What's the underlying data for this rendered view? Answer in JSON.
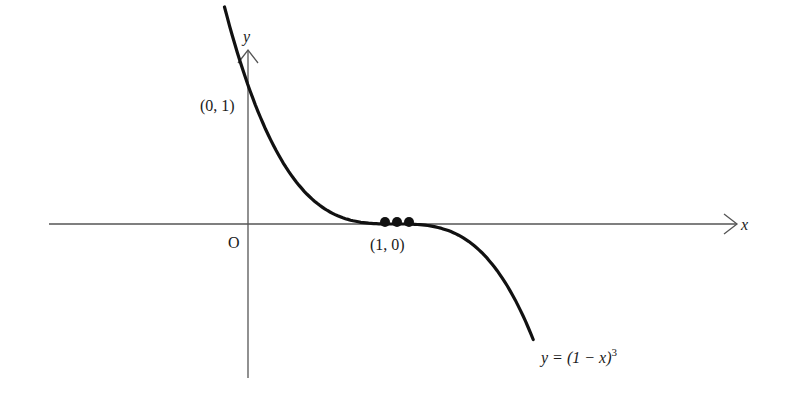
{
  "chart_data": {
    "type": "line",
    "title": "",
    "function": "y = (1 - x)^3",
    "xlabel": "x",
    "ylabel": "y",
    "origin_label": "O",
    "annotations": [
      {
        "text": "(0, 1)",
        "x": 0,
        "y": 1
      },
      {
        "text": "(1, 0)",
        "x": 1,
        "y": 0
      },
      {
        "text": "y = (1 − x)³",
        "x": 1.94,
        "y": -0.99
      }
    ],
    "x_range": [
      -0.16,
      1.94
    ],
    "y_range": [
      -1.1,
      1.2
    ],
    "series": [
      {
        "name": "y = (1 − x)^3",
        "x": [
          -0.16,
          0,
          0.25,
          0.5,
          0.75,
          1,
          1.25,
          1.5,
          1.75,
          1.94
        ],
        "y": [
          1.56,
          1,
          0.42,
          0.125,
          0.016,
          0,
          -0.016,
          -0.125,
          -0.42,
          -0.83
        ]
      }
    ],
    "highlight_points": {
      "x": [
        0.92,
        1,
        1.08
      ],
      "y": [
        0,
        0,
        0
      ],
      "note": "three dots marking the triple root (inflection) at (1, 0)"
    },
    "grid": false,
    "legend": "none"
  },
  "labels": {
    "y_axis": "y",
    "x_axis": "x",
    "origin": "O",
    "point_0_1": "(0, 1)",
    "point_1_0": "(1, 0)",
    "equation_main": "y = (1 − x)",
    "equation_exp": "3"
  },
  "colors": {
    "curve": "#111111",
    "axes": "#555555",
    "text": "#1a1a1a"
  }
}
